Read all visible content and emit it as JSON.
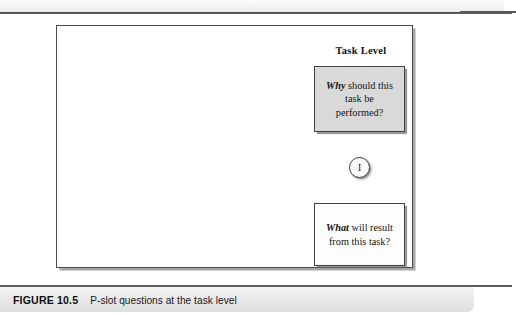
{
  "figure": {
    "diagram": {
      "heading": "Task Level",
      "why_box": {
        "emphasis": "Why",
        "rest": " should this task be performed?",
        "full_text": "Why should this task be performed?",
        "fill_color": "#d9d9d9"
      },
      "connector_node": {
        "label": "I",
        "shape": "circle"
      },
      "what_box": {
        "emphasis": "What",
        "rest": " will result from this task?",
        "full_text": "What will result from this task?",
        "fill_color": "#fdfdfd"
      }
    },
    "caption": {
      "label": "FIGURE 10.5",
      "text": "P-slot questions at the task level"
    }
  }
}
